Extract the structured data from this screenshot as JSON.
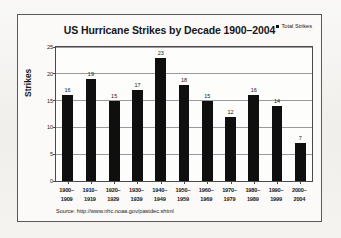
{
  "chart_data": {
    "type": "bar",
    "title": "US Hurricane Strikes by Decade 1900–2004",
    "xlabel": "",
    "ylabel": "Strikes",
    "categories": [
      "1900– 1909",
      "1910– 1919",
      "1920– 1929",
      "1930– 1939",
      "1940– 1949",
      "1950– 1959",
      "1960– 1969",
      "1970– 1979",
      "1980– 1989",
      "1990– 1999",
      "2000– 2004"
    ],
    "categories_lines": [
      [
        "1900–",
        "1909"
      ],
      [
        "1910–",
        "1919"
      ],
      [
        "1920–",
        "1929"
      ],
      [
        "1930–",
        "1939"
      ],
      [
        "1940–",
        "1949"
      ],
      [
        "1950–",
        "1959"
      ],
      [
        "1960–",
        "1969"
      ],
      [
        "1970–",
        "1979"
      ],
      [
        "1980–",
        "1989"
      ],
      [
        "1990–",
        "1999"
      ],
      [
        "2000–",
        "2004"
      ]
    ],
    "values": [
      16,
      19,
      15,
      17,
      23,
      18,
      15,
      12,
      16,
      14,
      7
    ],
    "series": [
      {
        "name": "Total Strikes",
        "values": [
          16,
          19,
          15,
          17,
          23,
          18,
          15,
          12,
          16,
          14,
          7
        ],
        "color": "#100f10"
      }
    ],
    "ylim": [
      0,
      25
    ],
    "yticks": [
      0,
      5,
      10,
      15,
      20,
      25
    ],
    "ytick_labels": [
      "0",
      "5",
      "10",
      "15",
      "20",
      "25"
    ],
    "grid": true,
    "legend_position": "top-right",
    "bar_color": "#100f10",
    "show_value_labels": true
  },
  "legend": {
    "entries": [
      {
        "label": "Total Strikes",
        "color": "#100f10",
        "marker": "square"
      }
    ]
  },
  "source": {
    "text": "Source: http://www.nhc.noaa.gov/pastdec.shtml"
  },
  "colors": {
    "bar": "#100f10",
    "grid": "#9a9a9c",
    "axis": "#4b4b4d",
    "frame": "#5a5a5c",
    "plot_background": "#fdfdfc",
    "card_background": "#fbfaf8",
    "page_background": "#f2f1ee",
    "text": "#17171a"
  }
}
